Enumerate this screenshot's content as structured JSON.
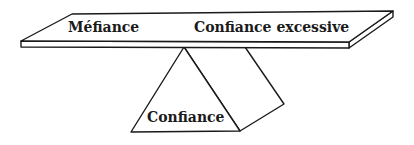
{
  "diagram": {
    "type": "balance-seesaw",
    "plank": {
      "left_label": "Méfiance",
      "right_label": "Confiance excessive"
    },
    "fulcrum": {
      "label": "Confiance"
    },
    "colors": {
      "stroke": "#1a1a1a",
      "fill": "#ffffff",
      "text": "#1a1a1a"
    }
  }
}
